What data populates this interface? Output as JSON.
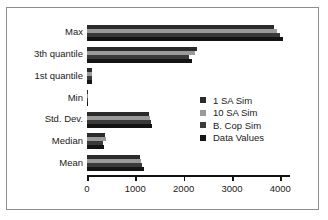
{
  "chart_data": {
    "type": "bar",
    "orientation": "horizontal",
    "title": "",
    "xlabel": "",
    "ylabel": "",
    "xlim": [
      0,
      4200
    ],
    "xticks": [
      0,
      1000,
      2000,
      3000,
      4000
    ],
    "xtick_labels": [
      "0",
      "1000",
      "2000",
      "3000",
      "4000"
    ],
    "grid": false,
    "legend_position": "center-right",
    "categories": [
      "Max",
      "3th quantile",
      "1st quantile",
      "Min",
      "Std. Dev.",
      "Median",
      "Mean"
    ],
    "series": [
      {
        "name": "1 SA Sim",
        "color": "#2b2b2b",
        "values": [
          3870,
          2280,
          95,
          5,
          1285,
          380,
          1090
        ]
      },
      {
        "name": "10 SA Sim",
        "color": "#9a9a9a",
        "values": [
          3930,
          2230,
          100,
          5,
          1300,
          385,
          1110
        ]
      },
      {
        "name": "B. Cop Sim",
        "color": "#3a3a3a",
        "values": [
          3990,
          2120,
          100,
          5,
          1315,
          330,
          1145
        ]
      },
      {
        "name": "Data Values",
        "color": "#141414",
        "values": [
          4050,
          2165,
          105,
          5,
          1340,
          345,
          1170
        ]
      }
    ]
  },
  "legend": {
    "items": [
      {
        "label": "1 SA Sim",
        "swatch": "#2b2b2b"
      },
      {
        "label": "10 SA Sim",
        "swatch": "#9a9a9a"
      },
      {
        "label": "B. Cop Sim",
        "swatch": "#3a3a3a"
      },
      {
        "label": "Data Values",
        "swatch": "#141414"
      }
    ]
  },
  "colors": {
    "background": "#ffffff",
    "frame_border": "#8d8d8d",
    "axis": "#111111",
    "text": "#1a1a1a"
  }
}
